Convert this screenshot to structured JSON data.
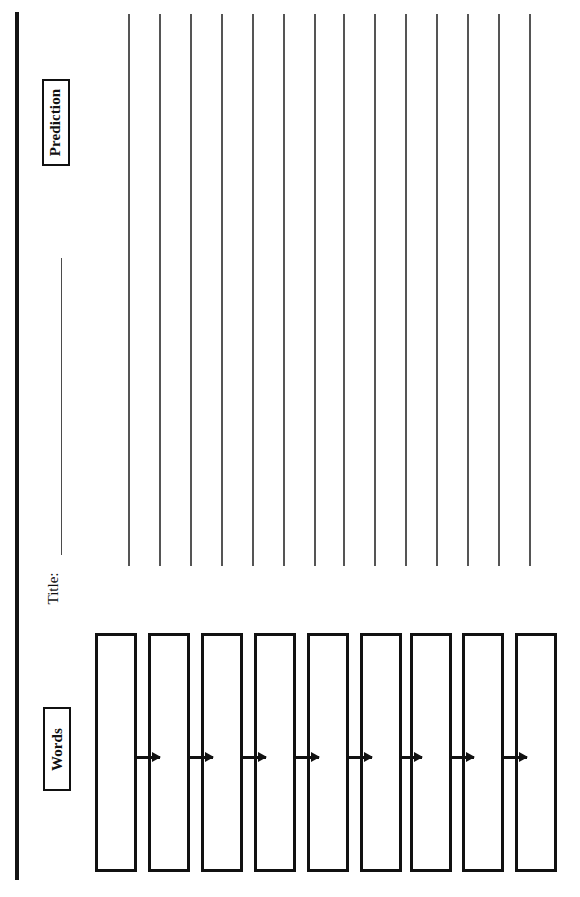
{
  "document": {
    "type": "worksheet",
    "orientation": "rotated-90-ccw",
    "page_width": 580,
    "page_height": 897,
    "background_color": "#ffffff",
    "ink_color": "#111111"
  },
  "spine": {
    "name": "binding-edge",
    "color": "#141414",
    "x": 15,
    "y": 12,
    "width": 4,
    "height": 868
  },
  "sections": {
    "prediction": {
      "label": "Prediction",
      "label_box": {
        "x": 42,
        "y": 79,
        "width": 28,
        "height": 87,
        "border_color": "#111111"
      },
      "rule_color": "#555555",
      "line_count": 14,
      "line_top": 14,
      "line_height": 552,
      "line_x_positions": [
        128,
        159,
        190,
        221,
        252,
        283,
        314,
        343,
        374,
        405,
        436,
        467,
        498,
        529
      ]
    },
    "title": {
      "label": "Title:",
      "rule_color": "#4b4b4b",
      "rule": {
        "x": 61,
        "y": 258,
        "width": 1.4,
        "height": 297
      }
    },
    "words": {
      "label": "Words",
      "label_box": {
        "x": 43,
        "y": 707,
        "width": 28,
        "height": 84,
        "border_color": "#111111"
      },
      "box_count": 9,
      "box_top": 633,
      "box_width": 42,
      "box_height": 239,
      "box_border_color": "#111111",
      "box_x_positions": [
        95,
        148,
        201,
        254,
        307,
        360,
        410,
        462,
        515
      ],
      "box_values": [
        "",
        "",
        "",
        "",
        "",
        "",
        "",
        "",
        ""
      ],
      "arrow_count": 8,
      "arrow_color": "#111111",
      "arrow_top": 756,
      "arrows": [
        {
          "x": 137,
          "width": 23
        },
        {
          "x": 190,
          "width": 23
        },
        {
          "x": 243,
          "width": 23
        },
        {
          "x": 296,
          "width": 23
        },
        {
          "x": 349,
          "width": 23
        },
        {
          "x": 399,
          "width": 23
        },
        {
          "x": 451,
          "width": 23
        },
        {
          "x": 504,
          "width": 23
        }
      ]
    }
  }
}
